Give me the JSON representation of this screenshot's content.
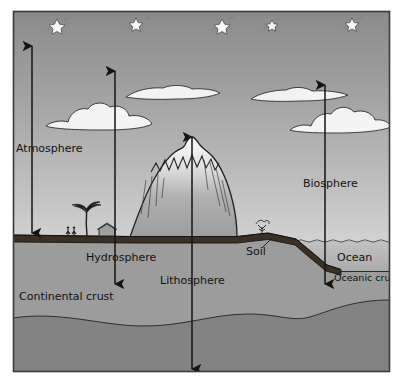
{
  "figure": {
    "kind": "earth-spheres-cross-section-diagram",
    "frame": {
      "border_color": "#3a3a3a",
      "x": 13,
      "y": 11,
      "width": 377,
      "height": 361
    }
  },
  "colors": {
    "sky_top": "#8f8f8f",
    "sky_bottom": "#cfcfcf",
    "ground": "#9a9a9a",
    "deep_crust": "#878787",
    "ocean_water": "#b9b9b9",
    "soil_band": "#3b3228",
    "mountain_light": "#f2f2f2",
    "mountain_body": "#a8a8a8",
    "cloud_fill": "#f4f4f4",
    "star_fill": "#f6f6f6",
    "ink": "#1b1b1b",
    "label_text": "#121212"
  },
  "labels": [
    {
      "id": "atmosphere",
      "text": "Atmosphere",
      "x": 16,
      "y": 152,
      "anchor": "start",
      "size": 11
    },
    {
      "id": "hydrosphere",
      "text": "Hydrosphere",
      "x": 86,
      "y": 261,
      "anchor": "start",
      "size": 11
    },
    {
      "id": "lithosphere",
      "text": "Lithosphere",
      "x": 160,
      "y": 284,
      "anchor": "start",
      "size": 11
    },
    {
      "id": "soil",
      "text": "Soil",
      "x": 246,
      "y": 255,
      "anchor": "start",
      "size": 11
    },
    {
      "id": "biosphere",
      "text": "Biosphere",
      "x": 303,
      "y": 187,
      "anchor": "start",
      "size": 11
    },
    {
      "id": "ocean",
      "text": "Ocean",
      "x": 337,
      "y": 261,
      "anchor": "start",
      "size": 11
    },
    {
      "id": "oceanic-crust",
      "text": "Oceanic crust",
      "x": 334,
      "y": 281,
      "anchor": "start",
      "size": 9.5
    },
    {
      "id": "continental-crust",
      "text": "Continental crust",
      "x": 19,
      "y": 300,
      "anchor": "start",
      "size": 11
    }
  ],
  "arrows": [
    {
      "id": "atmosphere-arrow",
      "x": 32,
      "y_top": 46,
      "y_bottom": 233,
      "heads": "both"
    },
    {
      "id": "hydrosphere-arrow",
      "x": 115,
      "y_top": 71,
      "y_bottom": 284,
      "heads": "both"
    },
    {
      "id": "lithosphere-arrow",
      "x": 192,
      "y_top": 137,
      "y_bottom": 369,
      "heads": "both"
    },
    {
      "id": "biosphere-arrow",
      "x": 325,
      "y_top": 85,
      "y_bottom": 284,
      "heads": "both"
    }
  ],
  "stars": [
    {
      "cx": 57,
      "cy": 26,
      "r": 7
    },
    {
      "cx": 136,
      "cy": 24,
      "r": 6
    },
    {
      "cx": 222,
      "cy": 26,
      "r": 7
    },
    {
      "cx": 272,
      "cy": 25,
      "r": 5
    },
    {
      "cx": 352,
      "cy": 24,
      "r": 6
    }
  ],
  "clouds": [
    {
      "id": "cloud-flat-left",
      "type": "flat",
      "cx": 172,
      "cy": 93,
      "w": 96,
      "h": 11
    },
    {
      "id": "cloud-cumulus-left",
      "type": "cumulus",
      "cx": 100,
      "cy": 116,
      "w": 112,
      "h": 22
    },
    {
      "id": "cloud-flat-right",
      "type": "flat",
      "cx": 302,
      "cy": 94,
      "w": 104,
      "h": 11
    },
    {
      "id": "cloud-cumulus-right",
      "type": "cumulus",
      "cx": 342,
      "cy": 119,
      "w": 106,
      "h": 22
    }
  ],
  "scene": {
    "ground_y": 237,
    "soil_band_thickness": 7,
    "ocean_surface_y": 241,
    "ocean_floor_y": 271,
    "shelf_break_x": 296,
    "mountain": {
      "left_x": 130,
      "right_x": 237,
      "peak_x": 192,
      "peak_y": 137
    },
    "features": [
      {
        "id": "palm-tree",
        "x": 87,
        "y": 237
      },
      {
        "id": "people",
        "x": 71,
        "y": 237
      },
      {
        "id": "hut",
        "x": 107,
        "y": 237
      },
      {
        "id": "shrub",
        "x": 262,
        "y": 234
      }
    ]
  }
}
